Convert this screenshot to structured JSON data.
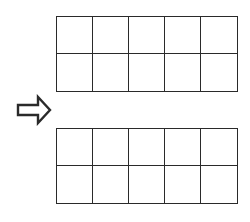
{
  "diagram": {
    "line_color": "#2a2a2a",
    "background": "#ffffff",
    "top_grid": {
      "rows": 2,
      "cols": 5,
      "cells": [
        [
          "",
          "",
          "",
          "",
          ""
        ],
        [
          "",
          "",
          "",
          "",
          ""
        ]
      ]
    },
    "arrow": {
      "direction": "right",
      "style": "hollow-block-arrow"
    },
    "bottom_grid": {
      "rows": 2,
      "cols": 5,
      "cells": [
        [
          "",
          "",
          "",
          "",
          ""
        ],
        [
          "",
          "",
          "",
          "",
          ""
        ]
      ]
    }
  }
}
